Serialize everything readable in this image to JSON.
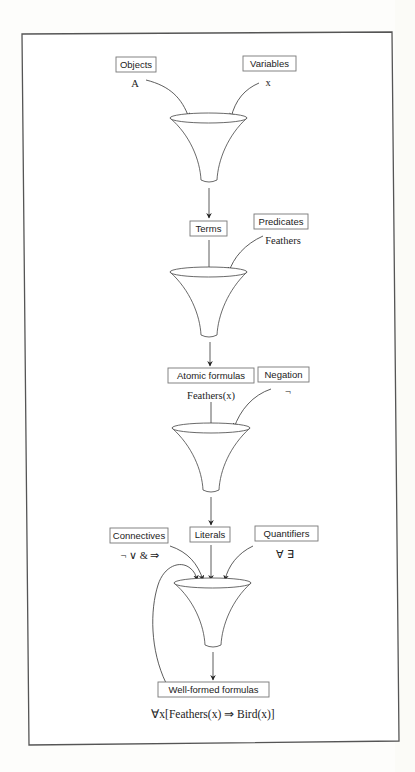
{
  "diagram": {
    "type": "funnel-flow",
    "stage1": {
      "inputs": [
        {
          "label": "Objects",
          "example": "A"
        },
        {
          "label": "Variables",
          "example": "x"
        }
      ],
      "output": {
        "label": "Terms",
        "example": ""
      }
    },
    "stage2": {
      "inputs": [
        {
          "label": "Terms",
          "example": ""
        },
        {
          "label": "Predicates",
          "example": "Feathers"
        }
      ],
      "output": {
        "label": "Atomic formulas",
        "example": "Feathers(x)"
      }
    },
    "stage3": {
      "inputs": [
        {
          "label": "Atomic formulas",
          "example": "Feathers(x)"
        },
        {
          "label": "Negation",
          "example": "¬"
        }
      ],
      "output": {
        "label": "Literals",
        "example": ""
      }
    },
    "stage4": {
      "inputs": [
        {
          "label": "Connectives",
          "example": "¬  ∨ &  ⇒"
        },
        {
          "label": "Literals",
          "example": ""
        },
        {
          "label": "Quantifiers",
          "example": "∀ ∃"
        }
      ],
      "output": {
        "label": "Well-formed formulas",
        "example": "∀x[Feathers(x) ⇒ Bird(x)]"
      },
      "feedback_loop": true
    }
  },
  "labels": {
    "objects": "Objects",
    "objects_example": "A",
    "variables": "Variables",
    "variables_example": "x",
    "terms": "Terms",
    "predicates": "Predicates",
    "predicates_example": "Feathers",
    "atomic_formulas": "Atomic formulas",
    "atomic_formulas_example": "Feathers(x)",
    "negation": "Negation",
    "negation_example": "¬",
    "connectives": "Connectives",
    "connectives_example": "¬  ∨ &  ⇒",
    "literals": "Literals",
    "quantifiers": "Quantifiers",
    "quantifiers_example": "∀ ∃",
    "wff": "Well-formed formulas",
    "wff_example": "∀x[Feathers(x) ⇒ Bird(x)]"
  }
}
